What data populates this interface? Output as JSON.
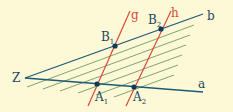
{
  "diagram": {
    "colors": {
      "background": "#fdf8d6",
      "ray": "#1c5a78",
      "hatch": "#6f9a6a",
      "transversal": "#d84a3a",
      "point": "#0d3a55",
      "label": "#1c4660",
      "label_red": "#d84a3a"
    },
    "vertex": {
      "label": "Z",
      "x": 25,
      "y": 78
    },
    "rays": [
      {
        "name": "b",
        "label": "b",
        "from": [
          25,
          78
        ],
        "to": [
          203,
          14
        ],
        "label_pos": [
          207,
          20
        ]
      },
      {
        "name": "a",
        "label": "a",
        "from": [
          25,
          78
        ],
        "to": [
          203,
          92
        ],
        "label_pos": [
          198,
          88
        ]
      }
    ],
    "transversals": [
      {
        "name": "g",
        "label": "g",
        "from": [
          88,
          106
        ],
        "to": [
          130,
          11
        ],
        "label_pos": [
          131,
          19
        ]
      },
      {
        "name": "h",
        "label": "h",
        "from": [
          126,
          106
        ],
        "to": [
          171,
          11
        ],
        "label_pos": [
          171,
          17
        ]
      }
    ],
    "points": [
      {
        "label": "B",
        "sub": "1",
        "x": 115,
        "y": 46,
        "label_pos": [
          101,
          41
        ]
      },
      {
        "label": "B",
        "sub": "2",
        "x": 161,
        "y": 29,
        "label_pos": [
          148,
          24
        ]
      },
      {
        "label": "A",
        "sub": "1",
        "x": 97,
        "y": 84,
        "label_pos": [
          95,
          101
        ]
      },
      {
        "label": "A",
        "sub": "2",
        "x": 134,
        "y": 87,
        "label_pos": [
          133,
          101
        ]
      }
    ],
    "hatch_lines": [
      {
        "from": [
          27,
          87
        ],
        "to": [
          194,
          25
        ]
      },
      {
        "from": [
          43,
          89
        ],
        "to": [
          190,
          35
        ]
      },
      {
        "from": [
          60,
          91
        ],
        "to": [
          186,
          45
        ]
      },
      {
        "from": [
          78,
          93
        ],
        "to": [
          182,
          55
        ]
      },
      {
        "from": [
          96,
          95
        ],
        "to": [
          178,
          65
        ]
      },
      {
        "from": [
          114,
          97
        ],
        "to": [
          174,
          75
        ]
      }
    ]
  }
}
